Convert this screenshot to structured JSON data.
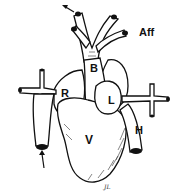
{
  "diagram": {
    "labels": {
      "aortic_bulb": "B",
      "right_atrium": "R",
      "left_atrium": "L",
      "ventricle": "V",
      "hepatic_vein": "H",
      "afferent_vessels": "Aff"
    },
    "signature": "JL",
    "colors": {
      "ink": "#111111",
      "background": "#ffffff"
    }
  }
}
